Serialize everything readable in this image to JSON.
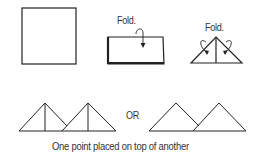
{
  "diagram": {
    "steps": [
      {
        "id": "square",
        "label": ""
      },
      {
        "id": "fold-half",
        "label": "Fold."
      },
      {
        "id": "fold-corners",
        "label": "Fold."
      }
    ],
    "or_label": "OR",
    "caption": "One point placed on top of another",
    "stroke_color": "#222222"
  }
}
